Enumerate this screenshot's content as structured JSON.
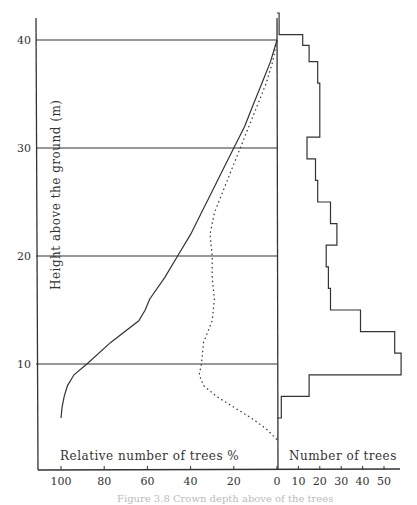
{
  "chart_data": [
    {
      "type": "line",
      "panel": "left",
      "title": "",
      "xlabel": "Relative number of trees %",
      "ylabel": "Height above the ground (m)",
      "xlim": [
        100,
        0
      ],
      "ylim": [
        0,
        42
      ],
      "x_reversed": true,
      "xticks": [
        100,
        80,
        60,
        40,
        20,
        0
      ],
      "yticks": [
        10,
        20,
        30,
        40
      ],
      "grid": "horizontal lines at 10, 20, 30, 40 m",
      "series": [
        {
          "name": "solid",
          "style": "solid",
          "points": [
            {
              "height": 5,
              "pct": 100
            },
            {
              "height": 6,
              "pct": 99.5
            },
            {
              "height": 7,
              "pct": 98.5
            },
            {
              "height": 8,
              "pct": 97
            },
            {
              "height": 9,
              "pct": 94
            },
            {
              "height": 10,
              "pct": 88
            },
            {
              "height": 12,
              "pct": 77
            },
            {
              "height": 14,
              "pct": 64
            },
            {
              "height": 15,
              "pct": 61
            },
            {
              "height": 16,
              "pct": 59
            },
            {
              "height": 18,
              "pct": 52
            },
            {
              "height": 20,
              "pct": 46
            },
            {
              "height": 22,
              "pct": 40
            },
            {
              "height": 24,
              "pct": 35
            },
            {
              "height": 26,
              "pct": 30
            },
            {
              "height": 28,
              "pct": 25
            },
            {
              "height": 30,
              "pct": 20
            },
            {
              "height": 32,
              "pct": 15
            },
            {
              "height": 34,
              "pct": 11
            },
            {
              "height": 36,
              "pct": 7
            },
            {
              "height": 38,
              "pct": 3
            },
            {
              "height": 39,
              "pct": 1.5
            },
            {
              "height": 40,
              "pct": 0
            }
          ]
        },
        {
          "name": "dotted",
          "style": "dotted",
          "points": [
            {
              "height": 3,
              "pct": 0
            },
            {
              "height": 4,
              "pct": 5
            },
            {
              "height": 5,
              "pct": 12
            },
            {
              "height": 6,
              "pct": 20
            },
            {
              "height": 7,
              "pct": 28
            },
            {
              "height": 8,
              "pct": 34
            },
            {
              "height": 9,
              "pct": 36
            },
            {
              "height": 10,
              "pct": 35
            },
            {
              "height": 12,
              "pct": 34
            },
            {
              "height": 14,
              "pct": 30
            },
            {
              "height": 16,
              "pct": 29
            },
            {
              "height": 18,
              "pct": 30
            },
            {
              "height": 20,
              "pct": 30
            },
            {
              "height": 22,
              "pct": 31
            },
            {
              "height": 24,
              "pct": 29
            },
            {
              "height": 26,
              "pct": 25
            },
            {
              "height": 28,
              "pct": 21
            },
            {
              "height": 30,
              "pct": 17
            },
            {
              "height": 32,
              "pct": 13
            },
            {
              "height": 34,
              "pct": 9
            },
            {
              "height": 36,
              "pct": 5
            },
            {
              "height": 38,
              "pct": 2
            },
            {
              "height": 40,
              "pct": 0
            }
          ]
        }
      ]
    },
    {
      "type": "bar",
      "orientation": "horizontal-step-histogram",
      "panel": "right",
      "xlabel": "Number of trees",
      "xlim": [
        0,
        55
      ],
      "xticks": [
        0,
        10,
        20,
        30,
        40,
        50
      ],
      "bins": [
        {
          "from": 5,
          "to": 7,
          "count": 2
        },
        {
          "from": 7,
          "to": 9,
          "count": 15
        },
        {
          "from": 9,
          "to": 11,
          "count": 58
        },
        {
          "from": 11,
          "to": 13,
          "count": 55
        },
        {
          "from": 13,
          "to": 15,
          "count": 39
        },
        {
          "from": 15,
          "to": 17,
          "count": 25
        },
        {
          "from": 17,
          "to": 19,
          "count": 24
        },
        {
          "from": 19,
          "to": 21,
          "count": 23
        },
        {
          "from": 21,
          "to": 23,
          "count": 28
        },
        {
          "from": 23,
          "to": 25,
          "count": 25
        },
        {
          "from": 25,
          "to": 27,
          "count": 19
        },
        {
          "from": 27,
          "to": 29,
          "count": 18
        },
        {
          "from": 29,
          "to": 31,
          "count": 14
        },
        {
          "from": 31,
          "to": 36,
          "count": 20
        },
        {
          "from": 36,
          "to": 38,
          "count": 19
        },
        {
          "from": 38,
          "to": 39.5,
          "count": 15
        },
        {
          "from": 39.5,
          "to": 40.5,
          "count": 12
        },
        {
          "from": 40.5,
          "to": 42.5,
          "count": 1
        }
      ]
    }
  ],
  "labels": {
    "y_axis_title": "Height above the ground (m)",
    "left_x_title": "Relative number of trees %",
    "right_x_title": "Number of trees",
    "caption": "Figure 3.8 Crown depth above of the trees",
    "left_x_ticks": [
      "100",
      "80",
      "60",
      "40",
      "20",
      "0"
    ],
    "right_x_ticks": [
      "10",
      "20",
      "30",
      "40",
      "50"
    ],
    "y_ticks": [
      "10",
      "20",
      "30",
      "40"
    ]
  }
}
